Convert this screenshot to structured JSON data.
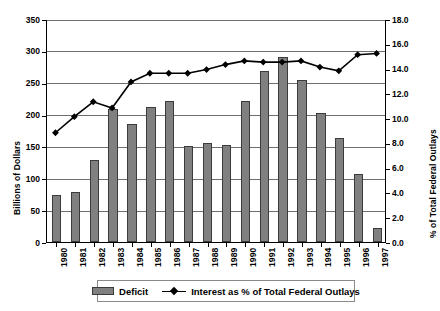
{
  "chart_data": {
    "type": "bar",
    "title": "",
    "subtitle": "",
    "xlabel": "",
    "ylabel": "Billions of Dollars",
    "y2label": "% of Total Federal Outlays",
    "grid": true,
    "legend_position": "bottom",
    "ylim": [
      0,
      350
    ],
    "y2lim": [
      0.0,
      18.0
    ],
    "yticks": [
      "0",
      "50",
      "100",
      "150",
      "200",
      "250",
      "300",
      "350"
    ],
    "y2ticks": [
      "0.0",
      "2.0",
      "4.0",
      "6.0",
      "8.0",
      "10.0",
      "12.0",
      "14.0",
      "16.0",
      "18.0"
    ],
    "categories": [
      "1980",
      "1981",
      "1982",
      "1983",
      "1984",
      "1985",
      "1986",
      "1987",
      "1988",
      "1989",
      "1990",
      "1991",
      "1992",
      "1993",
      "1994",
      "1995",
      "1996",
      "1997"
    ],
    "series": [
      {
        "name": "Deficit",
        "type": "bar",
        "axis": "left",
        "color": "#808080",
        "values": [
          74,
          79,
          128,
          208,
          185,
          212,
          221,
          150,
          155,
          153,
          221,
          269,
          290,
          255,
          203,
          164,
          107,
          22
        ]
      },
      {
        "name": "Interest as % of Total Federal Outlays",
        "type": "line",
        "axis": "right",
        "color": "#000000",
        "values": [
          8.9,
          10.2,
          11.4,
          10.9,
          13.0,
          13.7,
          13.7,
          13.7,
          14.0,
          14.4,
          14.7,
          14.6,
          14.6,
          14.7,
          14.2,
          13.9,
          15.2,
          15.3
        ]
      }
    ]
  },
  "legend": {
    "items": [
      {
        "label": "Deficit",
        "marker": "bar-swatch"
      },
      {
        "label": "Interest as % of Total Federal Outlays",
        "marker": "line-diamond-swatch"
      }
    ]
  }
}
